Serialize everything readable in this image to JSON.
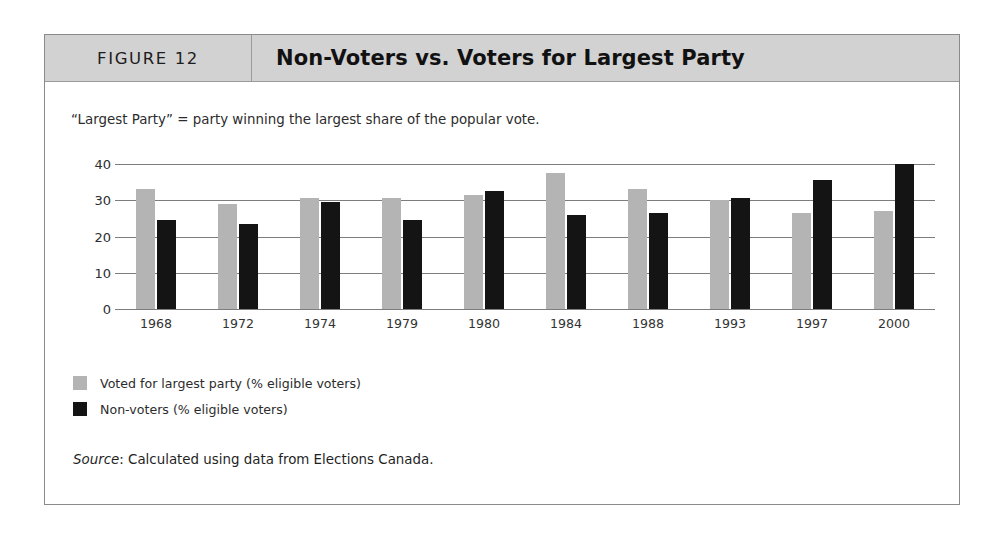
{
  "figure": {
    "number_label": "FIGURE 12",
    "title": "Non-Voters vs. Voters for Largest Party",
    "note": "“Largest Party” = party winning the largest share of the popular vote.",
    "source_word": "Source",
    "source_rest": ": Calculated using data from Elections Canada."
  },
  "colors": {
    "header_background": "#d2d2d2",
    "series_voted": "#b4b4b4",
    "series_nonvoters": "#141414",
    "gridline": "#7d7d7d",
    "frame_border": "#8a8a8a"
  },
  "legend": {
    "items": [
      {
        "label": "Voted for largest party (% eligible voters)",
        "color": "#b4b4b4"
      },
      {
        "label": "Non-voters (% eligible voters)",
        "color": "#141414"
      }
    ]
  },
  "chart_data": {
    "type": "bar",
    "title": "Non-Voters vs. Voters for Largest Party",
    "subtitle": "“Largest Party” = party winning the largest share of the popular vote.",
    "xlabel": "",
    "ylabel": "",
    "ylim": [
      0,
      40
    ],
    "yticks": [
      0,
      10,
      20,
      30,
      40
    ],
    "ytick_labels": [
      "0",
      "10",
      "20",
      "30",
      "40"
    ],
    "grid": true,
    "grid_axis": "y",
    "legend_position": "below-left",
    "categories": [
      "1968",
      "1972",
      "1974",
      "1979",
      "1980",
      "1984",
      "1988",
      "1993",
      "1997",
      "2000"
    ],
    "series": [
      {
        "name": "Voted for largest party (% eligible voters)",
        "color": "#b4b4b4",
        "values": [
          33.0,
          29.0,
          30.5,
          30.5,
          31.5,
          37.5,
          33.0,
          30.0,
          26.5,
          27.0
        ]
      },
      {
        "name": "Non-voters (% eligible voters)",
        "color": "#141414",
        "values": [
          24.5,
          23.5,
          29.5,
          24.5,
          32.5,
          26.0,
          26.5,
          30.5,
          35.5,
          40.0
        ]
      }
    ],
    "source": "Source: Calculated using data from Elections Canada."
  }
}
